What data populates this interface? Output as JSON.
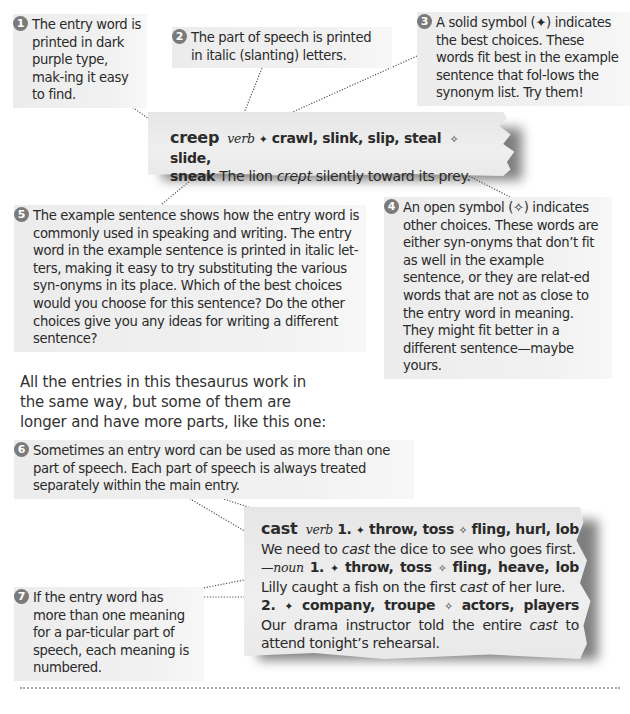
{
  "callouts": [
    {
      "number": "1",
      "text": "The entry word is printed in dark purple type, mak-ing it easy to find."
    },
    {
      "number": "2",
      "text": "The part of speech is printed in italic (slanting) letters."
    },
    {
      "number": "3",
      "text": "A solid symbol (✦) indicates the best choices. These words fit best in the example sentence that fol-lows the synonym list. Try them!"
    },
    {
      "number": "4",
      "text": "An open symbol (✧) indicates other choices. These words are either syn-onyms that don’t fit as well in the example sentence, or they are relat-ed words that are not as close to the entry word in meaning. They might fit better in a different sentence—maybe yours."
    },
    {
      "number": "5",
      "text": "The example sentence shows how the entry word is commonly used in speaking and writing. The entry word in the example sentence is printed in italic let-ters, making it easy to try substituting the various syn-onyms in its place. Which of the best choices would you choose for this sentence? Do the other choices give you any ideas for writing a different sentence?"
    },
    {
      "number": "6",
      "text": "Sometimes an entry word can be used as more than one part of speech. Each part of speech is always treated separately within the main entry."
    },
    {
      "number": "7",
      "text": "If the entry word has more than one meaning for a par-ticular part of speech, each meaning is numbered."
    }
  ],
  "intro_text": "All the entries in this thesaurus work in the same way, but some of them are longer and have more parts, like this one:",
  "entry_creep": {
    "headword": "creep",
    "pos": "verb",
    "solid_symbol": "✦",
    "best_choices": "crawl, slink, slip, steal",
    "open_symbol": "✧",
    "other_choices_1": "slide,",
    "other_choices_2": "sneak",
    "example_pre": "The lion",
    "example_italic": "crept",
    "example_post": "silently toward its prey."
  },
  "entry_cast": {
    "headword": "cast",
    "senses": [
      {
        "pos": "verb",
        "num": "1.",
        "solid_symbol": "✦",
        "best": "throw, toss",
        "open_symbol": "✧",
        "other": "fling, hurl, lob",
        "ex_pre": "We need to",
        "ex_italic": "cast",
        "ex_post": "the dice to see who goes first."
      },
      {
        "pos": "—noun",
        "num": "1.",
        "solid_symbol": "✦",
        "best": "throw, toss",
        "open_symbol": "✧",
        "other": "fling, heave, lob",
        "ex_pre": "Lilly caught a fish on the first",
        "ex_italic": "cast",
        "ex_post": "of her lure."
      },
      {
        "num": "2.",
        "solid_symbol": "✦",
        "best": "company, troupe",
        "open_symbol": "✧",
        "other": "actors, players",
        "ex_pre": "Our drama instructor told the entire",
        "ex_italic": "cast",
        "ex_post": "to attend tonight’s rehearsal."
      }
    ]
  },
  "colors": {
    "callout_bg": "#eeeeee",
    "number_badge": "#7a7a7a",
    "paper_bg": "#ebebeb",
    "text": "#2a2a2a",
    "divider": "#a9a9a9"
  }
}
